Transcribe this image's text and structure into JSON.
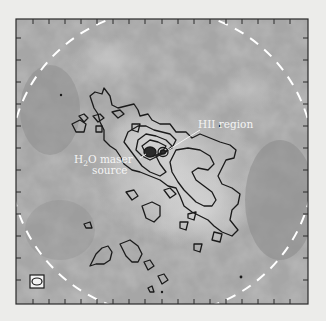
{
  "figure": {
    "type": "astronomical grayscale map with contour overlay",
    "annotations": {
      "hii_region": "HII region",
      "maser_line1_main": "H",
      "maser_line1_sub": "2",
      "maser_line1_rest": "O maser",
      "maser_line2": "source"
    },
    "beam_symbol": "ellipse",
    "field_of_view": "dashed circle",
    "colors": {
      "page_background": "#ececea",
      "map_mid_gray": "#a8a8a8",
      "contour": "#1a1a1a",
      "dashed_circle": "#ffffff",
      "frame": "#2a2a2a"
    }
  }
}
